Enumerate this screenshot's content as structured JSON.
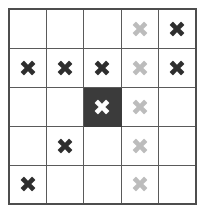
{
  "figure": {
    "type": "grid-diagram",
    "rows": 5,
    "columns": 5,
    "colors": {
      "background": "#ffffff",
      "grid_line": "#5a5a5a",
      "outer_border": "#4d4d4d",
      "mark_dark": "#2e2e2e",
      "mark_light": "#bcbcbc",
      "mark_white": "#ffffff",
      "cell_highlight_fill": "#3b3b3b"
    },
    "legend": {
      "dark_mark": "dark cross",
      "light_mark": "light gray cross",
      "highlighted_cell": "filled dark cell with white cross"
    },
    "icon_names": {
      "mark": "cross-icon",
      "empty": "empty-cell"
    },
    "cells": [
      [
        {
          "mark": "none",
          "fill": "white",
          "name": "cell-r1-c1"
        },
        {
          "mark": "none",
          "fill": "white",
          "name": "cell-r1-c2"
        },
        {
          "mark": "none",
          "fill": "white",
          "name": "cell-r1-c3"
        },
        {
          "mark": "light",
          "fill": "white",
          "name": "cell-r1-c4"
        },
        {
          "mark": "dark",
          "fill": "white",
          "name": "cell-r1-c5"
        }
      ],
      [
        {
          "mark": "dark",
          "fill": "white",
          "name": "cell-r2-c1"
        },
        {
          "mark": "dark",
          "fill": "white",
          "name": "cell-r2-c2"
        },
        {
          "mark": "dark",
          "fill": "white",
          "name": "cell-r2-c3"
        },
        {
          "mark": "light",
          "fill": "white",
          "name": "cell-r2-c4"
        },
        {
          "mark": "dark",
          "fill": "white",
          "name": "cell-r2-c5"
        }
      ],
      [
        {
          "mark": "none",
          "fill": "white",
          "name": "cell-r3-c1"
        },
        {
          "mark": "none",
          "fill": "white",
          "name": "cell-r3-c2"
        },
        {
          "mark": "white",
          "fill": "dark",
          "name": "cell-r3-c3"
        },
        {
          "mark": "light",
          "fill": "white",
          "name": "cell-r3-c4"
        },
        {
          "mark": "none",
          "fill": "white",
          "name": "cell-r3-c5"
        }
      ],
      [
        {
          "mark": "none",
          "fill": "white",
          "name": "cell-r4-c1"
        },
        {
          "mark": "dark",
          "fill": "white",
          "name": "cell-r4-c2"
        },
        {
          "mark": "none",
          "fill": "white",
          "name": "cell-r4-c3"
        },
        {
          "mark": "light",
          "fill": "white",
          "name": "cell-r4-c4"
        },
        {
          "mark": "none",
          "fill": "white",
          "name": "cell-r4-c5"
        }
      ],
      [
        {
          "mark": "dark",
          "fill": "white",
          "name": "cell-r5-c1"
        },
        {
          "mark": "none",
          "fill": "white",
          "name": "cell-r5-c2"
        },
        {
          "mark": "none",
          "fill": "white",
          "name": "cell-r5-c3"
        },
        {
          "mark": "light",
          "fill": "white",
          "name": "cell-r5-c4"
        },
        {
          "mark": "none",
          "fill": "white",
          "name": "cell-r5-c5"
        }
      ]
    ]
  }
}
